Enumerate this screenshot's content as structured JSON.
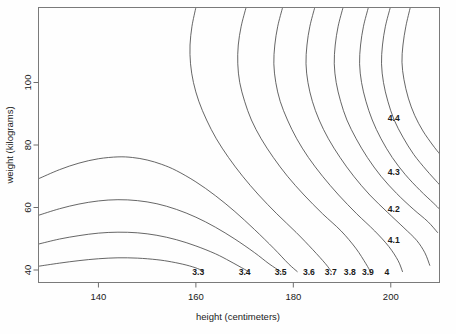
{
  "chart_data": {
    "type": "line",
    "subtype": "contour",
    "title": "",
    "xlabel": "height (centimeters)",
    "ylabel": "weight (kilograms)",
    "xlim": [
      127.7,
      210.0
    ],
    "ylim": [
      36.0,
      124.0
    ],
    "xticks": [
      140,
      160,
      180,
      200
    ],
    "xtick_labels": [
      "140",
      "160",
      "180",
      "200"
    ],
    "yticks": [
      40,
      60,
      80,
      100
    ],
    "ytick_labels": [
      "40",
      "60",
      "80",
      "100"
    ],
    "grid": false,
    "legend": "none",
    "contour_levels": [
      3.3,
      3.4,
      3.5,
      3.6,
      3.7,
      3.8,
      3.9,
      4.0,
      4.1,
      4.2,
      4.3,
      4.4
    ],
    "level_labels": [
      "3.3",
      "3.4",
      "3.5",
      "3.6",
      "3.7",
      "3.8",
      "3.9",
      "4",
      "4.1",
      "4.2",
      "4.3",
      "4.4"
    ],
    "contour_label_positions": [
      {
        "label": "3.3",
        "x": 160.5,
        "y": 39.0,
        "placement": "bottom"
      },
      {
        "label": "3.4",
        "x": 170.0,
        "y": 39.0,
        "placement": "bottom"
      },
      {
        "label": "3.5",
        "x": 177.4,
        "y": 39.0,
        "placement": "bottom"
      },
      {
        "label": "3.6",
        "x": 183.2,
        "y": 39.0,
        "placement": "bottom"
      },
      {
        "label": "3.7",
        "x": 187.7,
        "y": 39.0,
        "placement": "bottom"
      },
      {
        "label": "3.8",
        "x": 191.6,
        "y": 39.0,
        "placement": "bottom"
      },
      {
        "label": "3.9",
        "x": 195.3,
        "y": 39.0,
        "placement": "bottom"
      },
      {
        "label": "4",
        "x": 199.2,
        "y": 39.0,
        "placement": "bottom"
      },
      {
        "label": "4.1",
        "x": 200.6,
        "y": 49.5,
        "placement": "right"
      },
      {
        "label": "4.2",
        "x": 200.6,
        "y": 59.4,
        "placement": "right"
      },
      {
        "label": "4.3",
        "x": 200.6,
        "y": 71.0,
        "placement": "right"
      },
      {
        "label": "4.4",
        "x": 200.6,
        "y": 88.5,
        "placement": "right"
      }
    ],
    "series": [
      {
        "name": "3.3",
        "points": [
          [
            127.7,
            41.2
          ],
          [
            132,
            42.2
          ],
          [
            136,
            43.0
          ],
          [
            140,
            43.6
          ],
          [
            144,
            43.9
          ],
          [
            148,
            43.8
          ],
          [
            152,
            43.3
          ],
          [
            155,
            42.6
          ],
          [
            158,
            41.6
          ],
          [
            160.3,
            40.5
          ],
          [
            161.5,
            39.6
          ]
        ]
      },
      {
        "name": "3.4",
        "points": [
          [
            127.7,
            48.3
          ],
          [
            132,
            49.9
          ],
          [
            136,
            51.0
          ],
          [
            140,
            51.8
          ],
          [
            144,
            52.1
          ],
          [
            148,
            51.9
          ],
          [
            152,
            51.1
          ],
          [
            156,
            49.7
          ],
          [
            160,
            47.7
          ],
          [
            164,
            45.2
          ],
          [
            167,
            42.8
          ],
          [
            170,
            40.2
          ],
          [
            170.8,
            39.5
          ]
        ]
      },
      {
        "name": "3.5",
        "points": [
          [
            127.7,
            57.5
          ],
          [
            132,
            59.6
          ],
          [
            136,
            61.1
          ],
          [
            140,
            62.1
          ],
          [
            144,
            62.5
          ],
          [
            148,
            62.2
          ],
          [
            152,
            61.2
          ],
          [
            156,
            59.4
          ],
          [
            160,
            56.9
          ],
          [
            164,
            53.7
          ],
          [
            168,
            49.9
          ],
          [
            172,
            45.6
          ],
          [
            175,
            42.0
          ],
          [
            177.4,
            39.5
          ]
        ]
      },
      {
        "name": "3.6",
        "points": [
          [
            127.7,
            69.2
          ],
          [
            132,
            72.1
          ],
          [
            136,
            74.2
          ],
          [
            140,
            75.6
          ],
          [
            144,
            76.2
          ],
          [
            147,
            76.0
          ],
          [
            150,
            75.2
          ],
          [
            153,
            73.8
          ],
          [
            156,
            71.8
          ],
          [
            160,
            68.2
          ],
          [
            164,
            63.8
          ],
          [
            168,
            58.7
          ],
          [
            172,
            53.0
          ],
          [
            176,
            46.9
          ],
          [
            179,
            42.0
          ],
          [
            180.8,
            39.5
          ]
        ]
      },
      {
        "name": "3.7",
        "points": [
          [
            160.0,
            124.0
          ],
          [
            159.2,
            118
          ],
          [
            158.8,
            112
          ],
          [
            158.9,
            106
          ],
          [
            159.5,
            100
          ],
          [
            160.6,
            94
          ],
          [
            162.2,
            88
          ],
          [
            164.2,
            82
          ],
          [
            166.7,
            76
          ],
          [
            169.6,
            70
          ],
          [
            172.9,
            64
          ],
          [
            176.6,
            58
          ],
          [
            180.6,
            52
          ],
          [
            184.0,
            46.5
          ],
          [
            186.6,
            42.0
          ],
          [
            187.8,
            39.5
          ]
        ]
      },
      {
        "name": "3.8",
        "points": [
          [
            170.3,
            124.0
          ],
          [
            169.3,
            118
          ],
          [
            168.7,
            112
          ],
          [
            168.6,
            106
          ],
          [
            169.0,
            100
          ],
          [
            170.0,
            94
          ],
          [
            171.4,
            88
          ],
          [
            173.4,
            82
          ],
          [
            175.9,
            76
          ],
          [
            178.8,
            70
          ],
          [
            182.2,
            64
          ],
          [
            186.0,
            58
          ],
          [
            189.8,
            52.5
          ],
          [
            192.8,
            47
          ],
          [
            194.9,
            42.0
          ],
          [
            195.8,
            39.5
          ]
        ]
      },
      {
        "name": "3.9",
        "points": [
          [
            177.8,
            124.0
          ],
          [
            176.8,
            118
          ],
          [
            176.2,
            112
          ],
          [
            176.0,
            106
          ],
          [
            176.4,
            100
          ],
          [
            177.3,
            94
          ],
          [
            178.8,
            88
          ],
          [
            180.7,
            82
          ],
          [
            183.1,
            76
          ],
          [
            186.0,
            70
          ],
          [
            189.3,
            64
          ],
          [
            193.0,
            58
          ],
          [
            196.7,
            52.5
          ],
          [
            199.6,
            47.5
          ],
          [
            201.5,
            43.0
          ],
          [
            202.4,
            39.5
          ]
        ]
      },
      {
        "name": "4",
        "points": [
          [
            184.4,
            124.0
          ],
          [
            183.4,
            118
          ],
          [
            182.8,
            112
          ],
          [
            182.6,
            106
          ],
          [
            183.0,
            100
          ],
          [
            183.9,
            94
          ],
          [
            185.3,
            88
          ],
          [
            187.2,
            82
          ],
          [
            189.6,
            76
          ],
          [
            192.4,
            70
          ],
          [
            195.7,
            64
          ],
          [
            199.3,
            58.5
          ],
          [
            202.7,
            53.5
          ],
          [
            205.3,
            49.5
          ],
          [
            207.0,
            45.5
          ],
          [
            208.0,
            41.5
          ]
        ]
      },
      {
        "name": "4.1",
        "points": [
          [
            190.2,
            124.0
          ],
          [
            189.2,
            118
          ],
          [
            188.6,
            112
          ],
          [
            188.4,
            106
          ],
          [
            188.8,
            100
          ],
          [
            189.7,
            94
          ],
          [
            191.0,
            88
          ],
          [
            192.9,
            82
          ],
          [
            195.2,
            76
          ],
          [
            198.0,
            70
          ],
          [
            201.2,
            64.5
          ],
          [
            204.6,
            59.5
          ],
          [
            207.6,
            55.5
          ],
          [
            209.6,
            52.0
          ]
        ]
      },
      {
        "name": "4.2",
        "points": [
          [
            195.4,
            124.0
          ],
          [
            194.4,
            118
          ],
          [
            193.8,
            112
          ],
          [
            193.6,
            106
          ],
          [
            194.0,
            100
          ],
          [
            194.9,
            94
          ],
          [
            196.2,
            88
          ],
          [
            198.0,
            82
          ],
          [
            200.3,
            76
          ],
          [
            203.0,
            70.5
          ],
          [
            206.0,
            65.5
          ],
          [
            208.7,
            61.5
          ],
          [
            210.0,
            59.5
          ]
        ]
      },
      {
        "name": "4.3",
        "points": [
          [
            199.9,
            124.0
          ],
          [
            198.9,
            118
          ],
          [
            198.3,
            112
          ],
          [
            198.1,
            106
          ],
          [
            198.5,
            100
          ],
          [
            199.4,
            94
          ],
          [
            200.7,
            88
          ],
          [
            202.5,
            82.5
          ],
          [
            204.7,
            77
          ],
          [
            207.3,
            72
          ],
          [
            209.6,
            68.0
          ],
          [
            210.0,
            67.3
          ]
        ]
      },
      {
        "name": "4.4",
        "points": [
          [
            204.0,
            124.0
          ],
          [
            203.1,
            118
          ],
          [
            202.5,
            112
          ],
          [
            202.3,
            106.5
          ],
          [
            202.7,
            101
          ],
          [
            203.6,
            95
          ],
          [
            204.9,
            89.5
          ],
          [
            206.6,
            84.5
          ],
          [
            208.6,
            80
          ],
          [
            210.0,
            77.2
          ]
        ]
      }
    ]
  },
  "axes": {
    "x_title": "height (centimeters)",
    "y_title": "weight (kilograms)"
  }
}
